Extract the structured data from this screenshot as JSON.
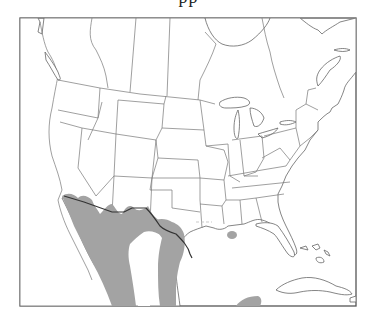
{
  "header": {
    "title_fragment": "pp"
  },
  "map": {
    "type": "species-range-map",
    "region": "North America (USA, southern Canada, Mexico, Caribbean)",
    "frame": {
      "x": 20,
      "y": 18,
      "width": 336,
      "height": 288
    },
    "colors": {
      "background": "#ffffff",
      "land": "#ffffff",
      "borders": "#666666",
      "international_border": "#333333",
      "range_fill": "#a3a3a3"
    },
    "legend": {
      "range": "Shaded area = species range"
    },
    "range_areas": [
      {
        "name": "southwest-mexico-range",
        "description": "Southern Arizona, southern New Mexico, west Texas, northwest and central Mexico"
      },
      {
        "name": "gulf-mexico-east-range",
        "description": "South Texas and eastern Mexico"
      },
      {
        "name": "louisiana-isolated-range",
        "description": "Small isolated patch in southern Louisiana"
      },
      {
        "name": "yucatan-range",
        "description": "Southern Mexico / Yucatan edge"
      }
    ]
  }
}
